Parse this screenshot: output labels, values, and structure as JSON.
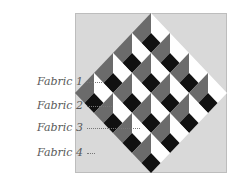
{
  "diagram": {
    "title": "",
    "type": "quilt-block-layout",
    "colors": {
      "background": "#d9d9d9",
      "fabric_grey": "#6b6b6b",
      "fabric_white": "#ffffff",
      "fabric_black": "#111111"
    },
    "labels": [
      {
        "text": "Fabric 1",
        "y": 82,
        "line_x1": 87,
        "line_x2": 102
      },
      {
        "text": "Fabric 2",
        "y": 106,
        "line_x1": 87,
        "line_x2": 112
      },
      {
        "text": "Fabric 3",
        "y": 128,
        "line_x1": 87,
        "line_x2": 140
      },
      {
        "text": "Fabric 4",
        "y": 153,
        "line_x1": 87,
        "line_x2": 95
      }
    ],
    "grid": {
      "rows": 4,
      "cols": 4
    }
  }
}
